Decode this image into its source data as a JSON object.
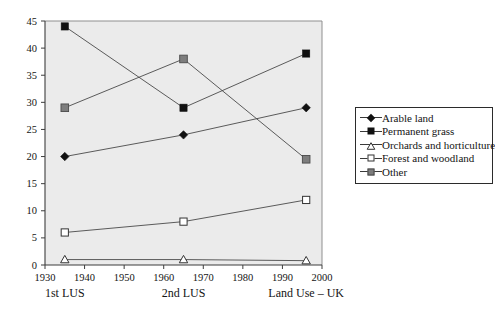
{
  "chart_data": {
    "type": "line",
    "title": "",
    "subtitle": "",
    "xlabel": "Land Use – UK",
    "ylabel": "",
    "x": [
      1935,
      1965,
      1996
    ],
    "xlim": [
      1930,
      2000
    ],
    "ylim": [
      0,
      45
    ],
    "grid": false,
    "legend_position": "right",
    "x_tick_labels": [
      "1930",
      "1940",
      "1950",
      "1960",
      "1970",
      "1980",
      "1990",
      "2000"
    ],
    "x_tick_values": [
      1930,
      1940,
      1950,
      1960,
      1970,
      1980,
      1990,
      2000
    ],
    "y_tick_labels": [
      "0",
      "5",
      "10",
      "15",
      "20",
      "25",
      "30",
      "35",
      "40",
      "45"
    ],
    "y_tick_values": [
      0,
      5,
      10,
      15,
      20,
      25,
      30,
      35,
      40,
      45
    ],
    "series": [
      {
        "name": "Arable land",
        "marker": "filled-diamond",
        "color": "#111111",
        "values": [
          20,
          24,
          29
        ]
      },
      {
        "name": "Permanent grass",
        "marker": "filled-square",
        "color": "#111111",
        "values": [
          44,
          29,
          39
        ]
      },
      {
        "name": "Orchards and horticulture",
        "marker": "open-triangle",
        "color": "#333333",
        "values": [
          1,
          1,
          0.8
        ]
      },
      {
        "name": "Forest and woodland",
        "marker": "open-square",
        "color": "#333333",
        "values": [
          6,
          8,
          12
        ]
      },
      {
        "name": "Other",
        "marker": "gray-square",
        "color": "#7d7d7d",
        "values": [
          29,
          38,
          19.5
        ]
      }
    ],
    "annotations": [
      {
        "text": "1st LUS",
        "x": 1935
      },
      {
        "text": "2nd LUS",
        "x": 1965
      },
      {
        "text": "Land Use – UK",
        "x": 1996
      }
    ]
  },
  "legend": {
    "entries": [
      {
        "label": "Arable land",
        "marker": "filled-diamond"
      },
      {
        "label": "Permanent grass",
        "marker": "filled-square"
      },
      {
        "label": "Orchards and horticulture",
        "marker": "open-triangle"
      },
      {
        "label": "Forest and woodland",
        "marker": "open-square"
      },
      {
        "label": "Other",
        "marker": "gray-square"
      }
    ]
  },
  "colors": {
    "plot_background": "#ebebeb",
    "plot_border": "#8a8a8a",
    "axis": "#3d3d3d",
    "series_line": "#4a4a4a",
    "text": "#141414",
    "legend_border": "#2b2b2b"
  }
}
